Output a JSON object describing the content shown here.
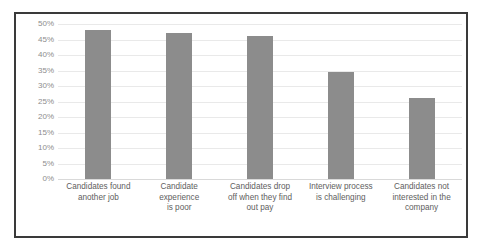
{
  "chart_data": {
    "type": "bar",
    "title": "",
    "subtitle": "",
    "xlabel": "",
    "ylabel": "",
    "ylim": [
      0,
      50
    ],
    "y_tick_step": 5,
    "y_tick_labels": [
      "50%",
      "45%",
      "40%",
      "35%",
      "30%",
      "25%",
      "20%",
      "15%",
      "10%",
      "5%",
      "0%"
    ],
    "y_tick_values": [
      50,
      45,
      40,
      35,
      30,
      25,
      20,
      15,
      10,
      5,
      0
    ],
    "value_suffix": "%",
    "categories": [
      "Candidates found another job",
      "Candidate experience is poor",
      "Candidates drop off when they find out pay",
      "Interview process is challenging",
      "Candidates not interested in the company"
    ],
    "category_lines": [
      [
        "Candidates found",
        "another job"
      ],
      [
        "Candidate",
        "experience",
        "is poor"
      ],
      [
        "Candidates drop",
        "off when they find",
        "out pay"
      ],
      [
        "Interview process",
        "is challenging"
      ],
      [
        "Candidates not",
        "interested in the",
        "company"
      ]
    ],
    "values": [
      48,
      47,
      46,
      34.5,
      26
    ],
    "series": [
      {
        "name": "Share of respondents",
        "values": [
          48,
          47,
          46,
          34.5,
          26
        ]
      }
    ],
    "grid": true,
    "grid_axis": "y",
    "legend": false,
    "legend_position": "none",
    "bar_color": "#8c8c8c",
    "grid_color": "#e9e9e9",
    "axis_text_color": "#8d8d8d",
    "category_text_color": "#5e5e5e",
    "plot_background": "#ffffff",
    "border_color": "#3a3a3a"
  }
}
